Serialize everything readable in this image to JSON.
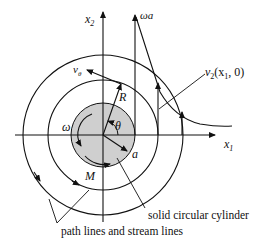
{
  "diagram": {
    "type": "rotating cylinder flow field",
    "axes": {
      "x_label": "x",
      "x_sub": "1",
      "y_label": "x",
      "y_sub": "2"
    },
    "labels": {
      "omega_a": "ωa",
      "v_theta": "v",
      "v_theta_sub": "θ",
      "v2_func_v": "v",
      "v2_func_sub": "2",
      "v2_func_args_open": "(x",
      "v2_func_args_sub": "1",
      "v2_func_args_close": ", 0)",
      "R": "R",
      "theta": "θ",
      "omega": "ω",
      "a": "a",
      "M": "M",
      "solid_cylinder": "solid circular cylinder",
      "path_lines": "path lines and stream lines"
    },
    "colors": {
      "line": "#111111",
      "cylinder_fill": "#cfcfcf",
      "background": "#ffffff"
    }
  }
}
